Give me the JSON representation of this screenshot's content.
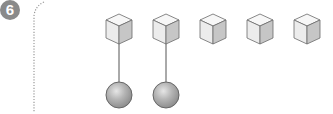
{
  "problem": {
    "number": "6"
  },
  "diagram": {
    "cubes": [
      {
        "x": 106,
        "attached": true
      },
      {
        "x": 153,
        "attached": true
      },
      {
        "x": 200,
        "attached": false
      },
      {
        "x": 247,
        "attached": false
      },
      {
        "x": 294,
        "attached": false
      }
    ],
    "balls": 2,
    "colors": {
      "badge": "#8a8a8a",
      "cube_top": "#f7f7f7",
      "cube_front": "#ebebeb",
      "cube_side": "#c4c4c4",
      "cube_edge": "#6a6a6a",
      "ball": "#b0b0b0",
      "ball_edge": "#666666",
      "dotted_line": "#9a9a9a"
    }
  }
}
